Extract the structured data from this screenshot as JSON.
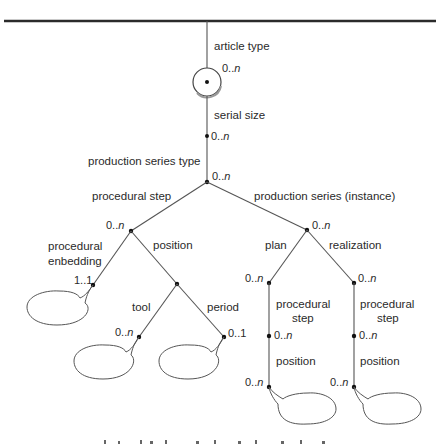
{
  "diagram": {
    "root": {
      "label": "article type",
      "cardinality_num": "0..",
      "cardinality_var": "n"
    },
    "nodes": {
      "serial_size": {
        "label": "serial size",
        "card_num": "0..",
        "card_var": "n"
      },
      "production_series_type": {
        "label": "production series type",
        "card_num": "0..",
        "card_var": "n"
      },
      "procedural_step": {
        "label": "procedural step",
        "card_num": "0..",
        "card_var": "n"
      },
      "production_series_instance": {
        "label": "production series (instance)",
        "card_num": "0..",
        "card_var": "n"
      },
      "procedural_embedding": {
        "label_line1": "procedural",
        "label_line2": "enbedding",
        "card": "1..1"
      },
      "position": {
        "label": "position"
      },
      "tool": {
        "label": "tool",
        "card_num": "0..",
        "card_var": "n"
      },
      "period": {
        "label": "period",
        "card": "0..1"
      },
      "plan": {
        "label": "plan",
        "card_num": "0..",
        "card_var": "n"
      },
      "realization": {
        "label": "realization",
        "card_num": "0..",
        "card_var": "n"
      },
      "plan_procedural_step": {
        "label_line1": "procedural",
        "label_line2": "step",
        "card_num": "0..",
        "card_var": "n"
      },
      "plan_position": {
        "label": "position",
        "card_num": "0..",
        "card_var": "n"
      },
      "real_procedural_step": {
        "label_line1": "procedural",
        "label_line2": "step",
        "card_num": "0..",
        "card_var": "n"
      },
      "real_position": {
        "label": "position",
        "card_num": "0..",
        "card_var": "n"
      }
    },
    "colors": {
      "line": "#555555",
      "node": "#111111",
      "text": "#2a2a2a"
    }
  }
}
